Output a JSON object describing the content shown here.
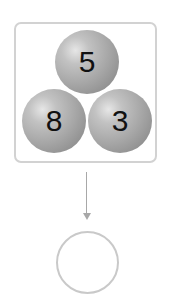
{
  "diagram": {
    "balls": [
      {
        "label": "5",
        "position": "top",
        "cx": 87,
        "cy": 62
      },
      {
        "label": "8",
        "position": "bottom-left",
        "cx": 54,
        "cy": 121
      },
      {
        "label": "3",
        "position": "bottom-right",
        "cx": 120,
        "cy": 121
      }
    ],
    "answer": "",
    "colors": {
      "box_border": "#d2d2d2",
      "ball": "#a6a6a6",
      "arrow": "#a8a8a8",
      "answer_circle_border": "#c9c9c9",
      "text": "#111111"
    }
  }
}
